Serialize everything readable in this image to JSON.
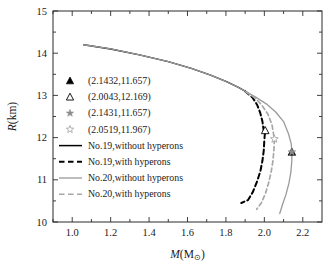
{
  "chart_data": {
    "type": "line",
    "title": "",
    "xlabel": "M(M⊙)",
    "ylabel": "R(km)",
    "xlim": [
      0.9,
      2.3
    ],
    "ylim": [
      10,
      15
    ],
    "xticks": [
      1.0,
      1.2,
      1.4,
      1.6,
      1.8,
      2.0,
      2.2
    ],
    "xtick_labels": [
      "1.0",
      "1.2",
      "1.4",
      "1.6",
      "1.8",
      "2.0",
      "2.2"
    ],
    "yticks": [
      10,
      11,
      12,
      13,
      14,
      15
    ],
    "ytick_labels": [
      "10",
      "11",
      "12",
      "13",
      "14",
      "15"
    ],
    "x_minor_tick_step": 0.1,
    "y_minor_tick_step": 0.5,
    "grid": false,
    "legend_position": "center-left",
    "frame": true,
    "series": [
      {
        "name": "No.19,without hyperons",
        "color": "#000000",
        "style": "solid",
        "width": 1.4,
        "points": [
          [
            1.06,
            14.2
          ],
          [
            1.2,
            14.1
          ],
          [
            1.35,
            13.96
          ],
          [
            1.5,
            13.8
          ],
          [
            1.62,
            13.64
          ],
          [
            1.72,
            13.48
          ],
          [
            1.8,
            13.33
          ],
          [
            1.86,
            13.2
          ],
          [
            1.9,
            13.1
          ]
        ]
      },
      {
        "name": "No.19,with hyperons",
        "color": "#000000",
        "style": "dashed",
        "width": 2.0,
        "points": [
          [
            1.9,
            13.1
          ],
          [
            1.938,
            12.95
          ],
          [
            1.962,
            12.78
          ],
          [
            1.979,
            12.58
          ],
          [
            1.99,
            12.38
          ],
          [
            1.9965,
            12.169
          ],
          [
            2.0043,
            12.169
          ],
          [
            2.0,
            11.95
          ],
          [
            1.997,
            11.7
          ],
          [
            1.99,
            11.45
          ],
          [
            1.979,
            11.2
          ],
          [
            1.962,
            10.96
          ],
          [
            1.941,
            10.72
          ],
          [
            1.915,
            10.52
          ],
          [
            1.88,
            10.45
          ]
        ]
      },
      {
        "name": "No.20,without hyperons",
        "color": "#9a9a9a",
        "style": "solid",
        "width": 1.3,
        "points": [
          [
            1.06,
            14.2
          ],
          [
            1.2,
            14.1
          ],
          [
            1.35,
            13.96
          ],
          [
            1.5,
            13.8
          ],
          [
            1.62,
            13.64
          ],
          [
            1.72,
            13.48
          ],
          [
            1.8,
            13.33
          ],
          [
            1.86,
            13.2
          ],
          [
            1.9,
            13.1
          ],
          [
            1.955,
            12.96
          ],
          [
            2.01,
            12.8
          ],
          [
            2.06,
            12.6
          ],
          [
            2.1,
            12.38
          ],
          [
            2.125,
            12.1
          ],
          [
            2.14,
            11.85
          ],
          [
            2.1432,
            11.657
          ],
          [
            2.143,
            11.45
          ],
          [
            2.138,
            11.18
          ],
          [
            2.128,
            10.92
          ],
          [
            2.113,
            10.66
          ],
          [
            2.095,
            10.42
          ],
          [
            2.08,
            10.2
          ]
        ]
      },
      {
        "name": "No.20,with hyperons",
        "color": "#a8a8a8",
        "style": "dashed",
        "width": 1.7,
        "points": [
          [
            1.905,
            13.08
          ],
          [
            1.948,
            12.95
          ],
          [
            1.985,
            12.78
          ],
          [
            2.018,
            12.56
          ],
          [
            2.04,
            12.3
          ],
          [
            2.0519,
            11.967
          ],
          [
            2.05,
            11.72
          ],
          [
            2.045,
            11.46
          ],
          [
            2.036,
            11.2
          ],
          [
            2.023,
            10.94
          ],
          [
            2.006,
            10.68
          ],
          [
            1.984,
            10.45
          ],
          [
            1.96,
            10.3
          ]
        ]
      }
    ],
    "markers": [
      {
        "label": "(2.1432,11.657)",
        "x": 2.1432,
        "y": 11.657,
        "shape": "triangle-filled",
        "color": "#000000"
      },
      {
        "label": "(2.0043,12.169)",
        "x": 2.0043,
        "y": 12.169,
        "shape": "triangle-open",
        "color": "#000000"
      },
      {
        "label": "(2.1431,11.657)",
        "x": 2.1431,
        "y": 11.657,
        "shape": "star-filled",
        "color": "#8c8c8c"
      },
      {
        "label": "(2.0519,11.967)",
        "x": 2.0519,
        "y": 11.967,
        "shape": "star-open",
        "color": "#9f9f9f"
      }
    ],
    "legend": {
      "markers": [
        {
          "text": "(2.1432,11.657)",
          "shape": "triangle-filled",
          "color": "#000000"
        },
        {
          "text": "(2.0043,12.169)",
          "shape": "triangle-open",
          "color": "#000000"
        },
        {
          "text": "(2.1431,11.657)",
          "shape": "star-filled",
          "color": "#8c8c8c"
        },
        {
          "text": "(2.0519,11.967)",
          "shape": "star-open",
          "color": "#9f9f9f"
        }
      ],
      "lines": [
        {
          "text": "No.19,without hyperons",
          "color": "#000000",
          "style": "solid",
          "width": 1.5
        },
        {
          "text": "No.19,with hyperons",
          "color": "#000000",
          "style": "dashed",
          "width": 2.0
        },
        {
          "text": "No.20,without hyperons",
          "color": "#9a9a9a",
          "style": "solid",
          "width": 1.3
        },
        {
          "text": "No.20,with hyperons",
          "color": "#a8a8a8",
          "style": "dashed",
          "width": 1.6
        }
      ]
    }
  }
}
